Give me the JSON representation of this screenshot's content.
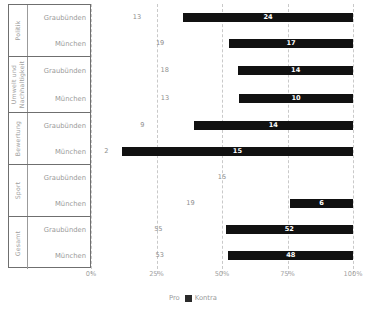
{
  "chart_data": {
    "type": "bar",
    "orientation": "horizontal",
    "stacked": true,
    "stack_mode": "percent",
    "title": "",
    "subtitle": "",
    "xlabel": "",
    "ylabel": "",
    "xlim": [
      0,
      100
    ],
    "xticks": [
      "0%",
      "25%",
      "50%",
      "75%",
      "100%"
    ],
    "xtick_values": [
      0,
      25,
      50,
      75,
      100
    ],
    "grid": true,
    "grid_style": "dashed-vertical",
    "legend_position": "bottom-center",
    "legend": [
      {
        "name": "Pro",
        "color": "#ffffff"
      },
      {
        "name": "Kontra",
        "color": "#2a2a2a"
      }
    ],
    "series": [
      {
        "name": "Pro",
        "color": "#ffffff",
        "values": [
          13,
          19,
          18,
          13,
          9,
          2,
          15,
          19,
          55,
          53
        ]
      },
      {
        "name": "Kontra",
        "color": "#111111",
        "values": [
          24,
          17,
          14,
          10,
          14,
          15,
          0,
          6,
          52,
          48
        ]
      }
    ],
    "groups": [
      {
        "label": "Politik",
        "two_line": false,
        "rows": [
          {
            "label": "Graubünden",
            "pro": 13,
            "kontra": 24
          },
          {
            "label": "München",
            "pro": 19,
            "kontra": 17
          }
        ]
      },
      {
        "label": "Umwelt und Nachhaltigkeit",
        "two_line": true,
        "rows": [
          {
            "label": "Graubünden",
            "pro": 18,
            "kontra": 14
          },
          {
            "label": "München",
            "pro": 13,
            "kontra": 10
          }
        ]
      },
      {
        "label": "Bewertung",
        "two_line": false,
        "rows": [
          {
            "label": "Graubünden",
            "pro": 9,
            "kontra": 14
          },
          {
            "label": "München",
            "pro": 2,
            "kontra": 15
          }
        ]
      },
      {
        "label": "Sport",
        "two_line": false,
        "rows": [
          {
            "label": "Graubünden",
            "pro": 15,
            "kontra": 0
          },
          {
            "label": "München",
            "pro": 19,
            "kontra": 6
          }
        ]
      },
      {
        "label": "Gesamt",
        "two_line": false,
        "rows": [
          {
            "label": "Graubünden",
            "pro": 55,
            "kontra": 52
          },
          {
            "label": "München",
            "pro": 53,
            "kontra": 48
          }
        ]
      }
    ]
  },
  "colors": {
    "kontra": "#111111",
    "pro": "#ffffff",
    "grid": "#c9c9c9",
    "text": "#9a9a9a",
    "border": "#6f6f6f"
  }
}
